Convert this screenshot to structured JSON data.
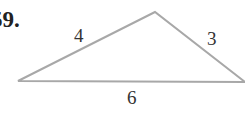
{
  "problem": {
    "number_label": "59."
  },
  "triangle": {
    "vertices": {
      "apex": [
        155,
        12
      ],
      "bottom_left": [
        18,
        81
      ],
      "bottom_right": [
        245,
        82
      ]
    },
    "sides": [
      {
        "name": "left",
        "length_label": "4"
      },
      {
        "name": "right",
        "length_label": "3"
      },
      {
        "name": "base",
        "length_label": "6"
      }
    ],
    "stroke_color": "#a8a8a8"
  }
}
